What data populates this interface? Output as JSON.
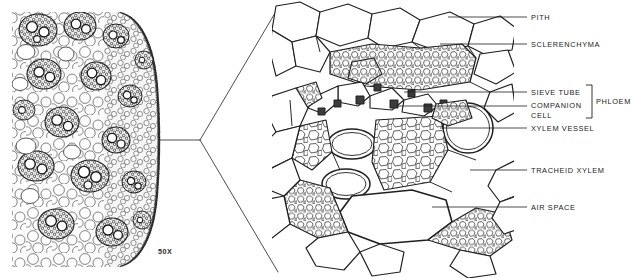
{
  "figure": {
    "background_color": "#ffffff",
    "ink_color": "#1a1a1a"
  },
  "micrograph": {
    "name": "monocot-stem-cross-section-micrograph",
    "magnification_label": "50X",
    "description": "Light micrograph of a monocot stem cross section showing scattered vascular bundles in ground parenchyma with a darker epidermal rind at the right margin."
  },
  "connector": {
    "name": "magnification-connector",
    "description": "V-shaped leader connecting the micrograph to the enlarged drawing"
  },
  "drawing": {
    "name": "vascular-bundle-detail-drawing",
    "description": "Line drawing enlargement of a single vascular bundle showing pith, sclerenchyma sheath, phloem, xylem vessels, tracheids and an air space."
  },
  "labels": [
    {
      "id": "pith",
      "text": "PITH",
      "x": 531,
      "y": 13,
      "leader_y": 17,
      "leader_x1": 448,
      "leader_x2": 527
    },
    {
      "id": "sclerenchyma",
      "text": "SCLERENCHYMA",
      "x": 531,
      "y": 40,
      "leader_y": 44,
      "leader_x1": 440,
      "leader_x2": 527
    },
    {
      "id": "sieve-tube",
      "text": "SIEVE TUBE",
      "x": 531,
      "y": 88,
      "leader_y": 92,
      "leader_x1": 404,
      "leader_x2": 527
    },
    {
      "id": "companion-cell",
      "text": "COMPANION",
      "x": 531,
      "y": 102,
      "leader_y": 106,
      "leader_x1": 396,
      "leader_x2": 527
    },
    {
      "id": "companion-cell-2",
      "text": "CELL",
      "x": 531,
      "y": 112,
      "leader_y": null,
      "leader_x1": null,
      "leader_x2": null
    },
    {
      "id": "xylem-vessel",
      "text": "XYLEM VESSEL",
      "x": 531,
      "y": 124,
      "leader_y": 128,
      "leader_x1": 440,
      "leader_x2": 527
    },
    {
      "id": "tracheid-xylem",
      "text": "TRACHEID XYLEM",
      "x": 531,
      "y": 166,
      "leader_y": 170,
      "leader_x1": 470,
      "leader_x2": 527
    },
    {
      "id": "air-space",
      "text": "AIR SPACE",
      "x": 531,
      "y": 203,
      "leader_y": 207,
      "leader_x1": 432,
      "leader_x2": 527
    }
  ],
  "bracket": {
    "name": "phloem-bracket",
    "text": "PHLOEM",
    "label_x": 598,
    "label_y": 100,
    "top": 85,
    "bottom": 118,
    "x": 592
  }
}
